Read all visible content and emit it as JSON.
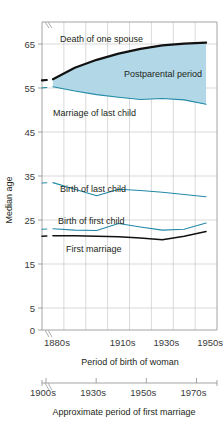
{
  "chart_data": {
    "type": "line",
    "title": "",
    "ylabel": "Median age",
    "xlabel": "Period of birth of woman",
    "xlabel_secondary": "Approximate period of first marriage",
    "ylim": [
      0,
      70
    ],
    "y_ticks": [
      0,
      5,
      15,
      25,
      35,
      45,
      55,
      65
    ],
    "y_tick_labels": [
      "0",
      "5",
      "15",
      "25",
      "35",
      "45",
      "55",
      "65"
    ],
    "y_axis_break": true,
    "grid": true,
    "legend_position": "inline-annotations",
    "x_categories": [
      "1880s",
      "1890s",
      "1900s",
      "1910s",
      "1920s",
      "1930s",
      "1940s",
      "1950s"
    ],
    "x_tick_labels": [
      "1880s",
      "1910s",
      "1930s",
      "1950s"
    ],
    "x_tick_label_indices": [
      0,
      3,
      5,
      7
    ],
    "x_secondary_tick_labels": [
      "1900s",
      "1930s",
      "1950s",
      "1970s"
    ],
    "colors": {
      "fill": "#b2d8e8",
      "teal_line": "#2389a6",
      "black_line": "#111111",
      "grid": "#c9c9c9",
      "frame": "#8d8d8d",
      "text": "#231f20"
    },
    "series": [
      {
        "name": "Death of one spouse",
        "color": "#111111",
        "style": "thick",
        "label": "Death of one spouse",
        "values": [
          57.0,
          59.6,
          61.4,
          62.8,
          63.9,
          64.7,
          65.1,
          65.3
        ]
      },
      {
        "name": "Marriage of last child",
        "color": "#2389a6",
        "style": "thin",
        "label": "Marriage of last child",
        "values": [
          55.3,
          54.3,
          53.5,
          52.9,
          52.4,
          52.6,
          52.3,
          51.3
        ]
      },
      {
        "name": "Birth of last child",
        "color": "#2389a6",
        "style": "thin",
        "label": "Birth of last child",
        "values": [
          33.5,
          32.0,
          30.5,
          32.0,
          31.7,
          31.3,
          30.8,
          30.3
        ]
      },
      {
        "name": "Birth of first child",
        "color": "#2389a6",
        "style": "thin",
        "label": "Birth of first child",
        "values": [
          23.0,
          22.7,
          22.6,
          24.2,
          23.4,
          22.7,
          22.9,
          24.3
        ]
      },
      {
        "name": "First marriage",
        "color": "#111111",
        "style": "medium",
        "label": "First marriage",
        "values": [
          21.4,
          21.4,
          21.3,
          21.2,
          20.9,
          20.5,
          21.3,
          22.4
        ]
      }
    ],
    "shaded_region": {
      "label": "Postparental period",
      "upper_series": "Death of one spouse",
      "lower_series": "Marriage of last child",
      "color": "#b2d8e8"
    },
    "annotations": [
      {
        "text": "Death of one spouse",
        "x": 60,
        "y": 42
      },
      {
        "text": "Postparental period",
        "x": 124,
        "y": 77
      },
      {
        "text": "Marriage of last child",
        "x": 53,
        "y": 116
      },
      {
        "text": "Birth of last child",
        "x": 60,
        "y": 192
      },
      {
        "text": "Birth of first child",
        "x": 58,
        "y": 224
      },
      {
        "text": "First marriage",
        "x": 66,
        "y": 252
      }
    ]
  }
}
